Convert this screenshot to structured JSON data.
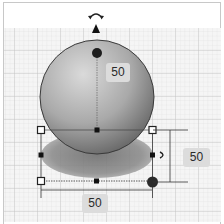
{
  "workplane": {
    "grid_color_minor": "#dedede",
    "grid_color_major": "#bdbdbd",
    "background": "#f4f4f4"
  },
  "object": {
    "shape": "sphere",
    "fill_light": "#d6d6d6",
    "fill_dark": "#6e6e6e",
    "shadow_color": "#8a8a8a"
  },
  "gizmos": {
    "rotate_icon": "rotate-arrow-icon",
    "lift_icon": "lift-cone-icon",
    "side_rotate_icon": "rotate-handle-icon"
  },
  "dimensions": {
    "height_label": "50",
    "depth_label": "50",
    "width_label": "50"
  }
}
